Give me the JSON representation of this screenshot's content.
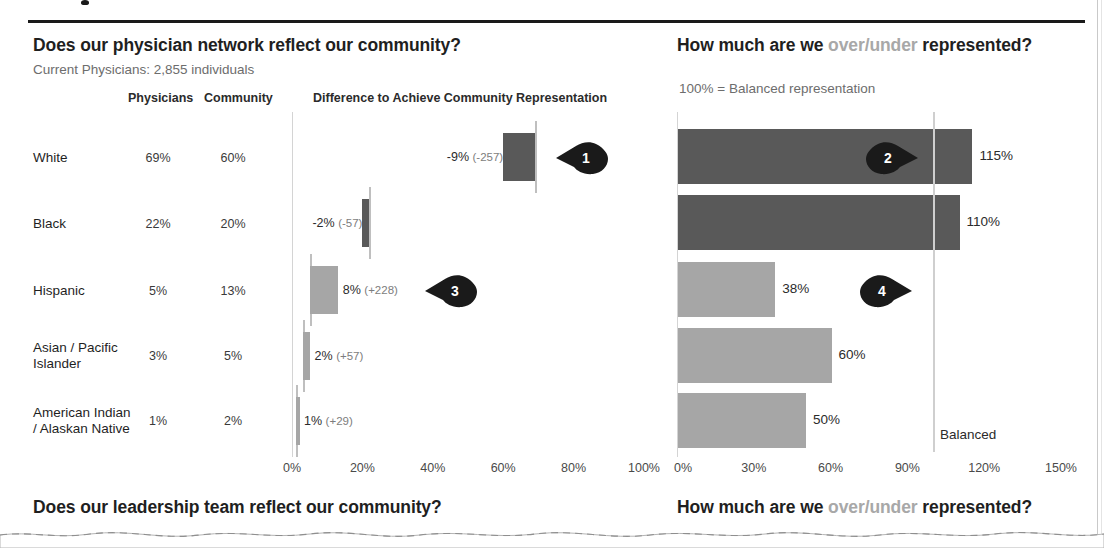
{
  "header": {
    "left_question_a": "Does our physician network reflect our community?",
    "left_subtitle": "Current Physicians: 2,855 individuals",
    "right_question_a": "How much are we ",
    "right_question_dim": "over/under",
    "right_question_b": " represented?",
    "right_subtitle": "100% = Balanced representation"
  },
  "columns": {
    "physicians": "Physicians",
    "community": "Community",
    "difference": "Difference to Achieve Community Representation"
  },
  "footer": {
    "left_question": "Does our leadership team reflect our community?",
    "right_question_a": "How much are we ",
    "right_question_dim": "over/under",
    "right_question_b": " represented?"
  },
  "rows": [
    {
      "label_line1": "White",
      "label_line2": "",
      "physicians": "69%",
      "community": "20%_placeholder"
    },
    {
      "label_line1": "Black",
      "label_line2": "",
      "physicians": "22%",
      "community": "20%"
    },
    {
      "label_line1": "Hispanic",
      "label_line2": "",
      "physicians": "5%",
      "community": "13%"
    },
    {
      "label_line1": "Asian / Pacific",
      "label_line2": "Islander",
      "physicians": "3%",
      "community": "5%"
    },
    {
      "label_line1": "American Indian",
      "label_line2": "/ Alaskan Native",
      "physicians": "1%",
      "community": "2%"
    }
  ],
  "row_community": [
    "60%",
    "20%",
    "13%",
    "5%",
    "2%"
  ],
  "callouts": [
    {
      "number": "1",
      "direction": "left"
    },
    {
      "number": "2",
      "direction": "right"
    },
    {
      "number": "3",
      "direction": "left"
    },
    {
      "number": "4",
      "direction": "right"
    }
  ],
  "balanced_label": "Balanced",
  "colors": {
    "dark_bar": "#595959",
    "light_bar": "#a6a6a6",
    "whisker": "#bfbfbf",
    "pin": "#1a1a1a",
    "dim_text": "#a8a8a8"
  },
  "chart_data": [
    {
      "type": "bar",
      "title": "Difference to Achieve Community Representation",
      "subtitle": "Current Physicians: 2,855 individuals",
      "categories": [
        "White",
        "Black",
        "Hispanic",
        "Asian / Pacific Islander",
        "American Indian / Alaskan Native"
      ],
      "series": [
        {
          "name": "Physicians",
          "values": [
            69,
            22,
            5,
            3,
            1
          ]
        },
        {
          "name": "Community",
          "values": [
            60,
            20,
            13,
            5,
            2
          ]
        }
      ],
      "difference_pct": [
        -9,
        -2,
        8,
        2,
        1
      ],
      "difference_count": [
        -257,
        -57,
        228,
        57,
        29
      ],
      "data_labels": [
        "-9% (-257)",
        "-2% (-57)",
        "8% (+228)",
        "2% (+57)",
        "1% (+29)"
      ],
      "bar_colors": [
        "#595959",
        "#595959",
        "#a6a6a6",
        "#a6a6a6",
        "#a6a6a6"
      ],
      "xlabel": "",
      "ylabel": "",
      "xlim": [
        0,
        100
      ],
      "xticks": [
        "0%",
        "20%",
        "40%",
        "60%",
        "80%",
        "100%"
      ],
      "grid": false,
      "legend": "none",
      "orientation": "horizontal",
      "note": "Floating/waterfall bars spanning community% to physician%, whisker marks physician share"
    },
    {
      "type": "bar",
      "title": "How much are we over/under represented?",
      "subtitle": "100% = Balanced representation",
      "categories": [
        "White",
        "Black",
        "Hispanic",
        "Asian / Pacific Islander",
        "American Indian / Alaskan Native"
      ],
      "values": [
        115,
        110,
        38,
        60,
        50
      ],
      "data_labels": [
        "115%",
        "110%",
        "38%",
        "60%",
        "50%"
      ],
      "bar_colors": [
        "#595959",
        "#595959",
        "#a6a6a6",
        "#a6a6a6",
        "#a6a6a6"
      ],
      "reference_line": {
        "value": 100,
        "label": "Balanced"
      },
      "xlabel": "",
      "ylabel": "",
      "xlim": [
        0,
        150
      ],
      "xticks": [
        "0%",
        "30%",
        "60%",
        "90%",
        "120%",
        "150%"
      ],
      "grid": false,
      "legend": "none",
      "orientation": "horizontal"
    }
  ]
}
